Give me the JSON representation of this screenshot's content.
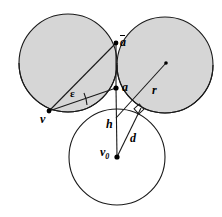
{
  "figure": {
    "type": "geometry-diagram",
    "canvas": {
      "width": 222,
      "height": 217
    },
    "colors": {
      "fill_gray": "#d6d6d6",
      "stroke": "#1a1a1a",
      "background": "#ffffff"
    },
    "circles": [
      {
        "name": "upper-left-circle",
        "cx": 68,
        "cy": 63,
        "r": 49,
        "fill": "#d6d6d6",
        "shaded": true
      },
      {
        "name": "upper-right-circle",
        "cx": 165,
        "cy": 65,
        "r": 48,
        "fill": "#d6d6d6",
        "shaded": true
      },
      {
        "name": "lower-center-circle",
        "cx": 117,
        "cy": 157,
        "r": 48,
        "fill": "none",
        "shaded": false
      }
    ],
    "points": [
      {
        "name": "point-a-bar",
        "label": "a",
        "overbar": true,
        "x": 116,
        "y": 43,
        "dot": true
      },
      {
        "name": "point-a",
        "label": "a",
        "overbar": false,
        "x": 116,
        "y": 88,
        "dot": true
      },
      {
        "name": "point-v",
        "label": "v",
        "overbar": false,
        "x": 49,
        "y": 111,
        "dot": true
      },
      {
        "name": "point-v0",
        "label": "v",
        "subscript": "0",
        "x": 117,
        "y": 157,
        "dot": true
      },
      {
        "name": "point-r-tip",
        "label": "",
        "x": 166,
        "y": 63,
        "dot": true
      },
      {
        "name": "point-foot-d",
        "label": "",
        "x": 139,
        "y": 110,
        "dot": false
      }
    ],
    "segments": [
      {
        "name": "segment-v-abar",
        "label": "",
        "from": "v",
        "to": "a-bar"
      },
      {
        "name": "segment-v-a",
        "label": "",
        "from": "v",
        "to": "a"
      },
      {
        "name": "segment-a-abar",
        "label": "",
        "from": "a",
        "to": "a-bar"
      },
      {
        "name": "segment-h",
        "label": "h",
        "from": "a",
        "to": "v0"
      },
      {
        "name": "segment-d",
        "label": "d",
        "from": "v0",
        "to": "foot-d"
      },
      {
        "name": "segment-r",
        "label": "r",
        "from": "a",
        "to": "r-tip"
      }
    ],
    "angles": [
      {
        "name": "angle-epsilon",
        "label": "ε",
        "vertex": "v",
        "between": [
          "v-abar",
          "v-a"
        ]
      }
    ],
    "markers": [
      {
        "name": "right-angle-marker",
        "at": "foot-d",
        "type": "square"
      }
    ],
    "labels": {
      "a_bar": "a",
      "a": "a",
      "r": "r",
      "h": "h",
      "d": "d",
      "v": "v",
      "v0_base": "v",
      "v0_sub": "0",
      "epsilon": "ε"
    }
  }
}
